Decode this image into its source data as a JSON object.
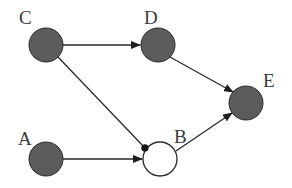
{
  "diagram": {
    "type": "directed-graph",
    "colors": {
      "filled_node": "#5c5c5c",
      "filled_node_stroke": "#2a2a2a",
      "hollow_node": "#ffffff",
      "edge": "#2a2a2a",
      "label": "#3a3a3a"
    },
    "nodes": [
      {
        "id": "A",
        "label": "A",
        "filled": true
      },
      {
        "id": "B",
        "label": "B",
        "filled": false
      },
      {
        "id": "C",
        "label": "C",
        "filled": true
      },
      {
        "id": "D",
        "label": "D",
        "filled": true
      },
      {
        "id": "E",
        "label": "E",
        "filled": true
      }
    ],
    "edges": [
      {
        "from": "C",
        "to": "D",
        "head": "arrow"
      },
      {
        "from": "C",
        "to": "B",
        "head": "dot"
      },
      {
        "from": "A",
        "to": "B",
        "head": "arrow"
      },
      {
        "from": "D",
        "to": "E",
        "head": "arrow"
      },
      {
        "from": "B",
        "to": "E",
        "head": "arrow"
      }
    ]
  }
}
